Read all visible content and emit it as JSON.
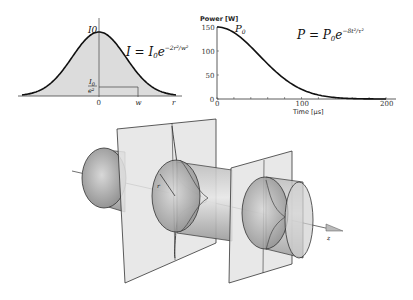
{
  "gaussian_profile": {
    "peak_label": "I0",
    "peak_label_sub": "0",
    "threshold_label_num": "I",
    "threshold_label_num_sub": "0",
    "threshold_label_den": "e²",
    "formula_lhs": "I = I",
    "formula_sub": "0",
    "formula_e": "e",
    "formula_exp": "−2r²/w²",
    "x_ticks": [
      "0",
      "w",
      "r"
    ]
  },
  "chart_data": {
    "type": "line",
    "title": "",
    "formula": "P = P0 e^(−8t²/τ²)",
    "formula_parts": {
      "lhs": "P = P",
      "sub": "0",
      "e": "e",
      "exp": "−8t²/τ²"
    },
    "peak_label": "P0",
    "xlabel": "Time [μs]",
    "ylabel": "Power [W]",
    "xlim": [
      0,
      200
    ],
    "ylim": [
      0,
      150
    ],
    "x_ticks": [
      "0",
      "100",
      "200"
    ],
    "y_ticks": [
      "0",
      "50",
      "100",
      "150"
    ],
    "series": [
      {
        "name": "Power",
        "peak": 150,
        "tau": 200,
        "x": [
          0,
          20,
          40,
          60,
          80,
          100,
          120,
          140,
          160,
          180,
          200
        ],
        "values": [
          150,
          138,
          109,
          73,
          45,
          20,
          8,
          3,
          1,
          0.3,
          0.05
        ]
      }
    ],
    "grid": false
  },
  "beam_diagram": {
    "radius_label": "r",
    "axis_label": "z"
  }
}
